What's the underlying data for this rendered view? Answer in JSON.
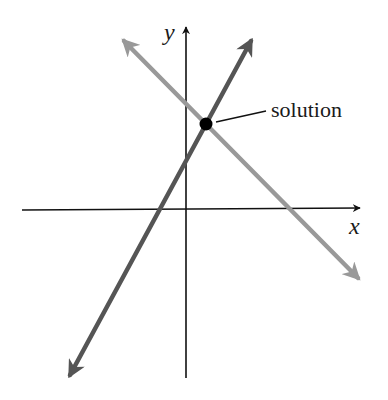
{
  "diagram": {
    "type": "system-of-linear-equations-graph",
    "axes": {
      "x_label": "x",
      "y_label": "y",
      "color": "#111111"
    },
    "lines": [
      {
        "name": "increasing-line",
        "color": "#555555",
        "slope_sign": "positive"
      },
      {
        "name": "decreasing-line",
        "color": "#999999",
        "slope_sign": "negative"
      }
    ],
    "intersection": {
      "label": "solution",
      "point_color": "#000000"
    }
  }
}
